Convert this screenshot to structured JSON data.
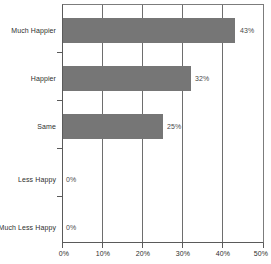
{
  "chart_data": {
    "type": "bar",
    "orientation": "horizontal",
    "title": "",
    "subtitle": "",
    "xlabel": "",
    "ylabel": "",
    "categories": [
      "Much Happier",
      "Happier",
      "Same",
      "Less Happy",
      "Much Less Happy"
    ],
    "values": [
      43,
      32,
      25,
      0,
      0
    ],
    "data_labels": [
      "43%",
      "32%",
      "25%",
      "0%",
      "0%"
    ],
    "xlim": [
      0,
      50
    ],
    "x_ticks": [
      0,
      10,
      20,
      30,
      40,
      50
    ],
    "x_tick_labels": [
      "0%",
      "10%",
      "20%",
      "30%",
      "40%",
      "50%"
    ],
    "grid": "vertical",
    "legend": "none",
    "bar_color": "#767676",
    "axis_color": "#5a5a5a",
    "gridline_color": "#6e6e6e",
    "label_color": "#2e2e2e",
    "value_label_color": "#4a4a4a",
    "background": "#ffffff"
  }
}
